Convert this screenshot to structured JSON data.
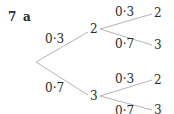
{
  "question": {
    "number": "7",
    "part": "a"
  },
  "tree": {
    "level1": [
      {
        "prob": "0·3",
        "outcome": "2"
      },
      {
        "prob": "0·7",
        "outcome": "3"
      }
    ],
    "level2": [
      {
        "prob": "0·3",
        "outcome": "2"
      },
      {
        "prob": "0·7",
        "outcome": "3"
      },
      {
        "prob": "0·3",
        "outcome": "2"
      },
      {
        "prob": "0·7",
        "outcome": "3"
      }
    ]
  },
  "colors": {
    "line": "#b5b5b5",
    "text": "#2a2a2a"
  }
}
